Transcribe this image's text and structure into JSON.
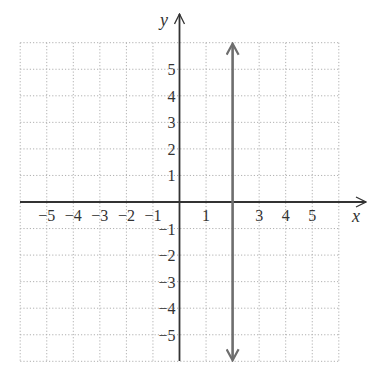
{
  "chart_data": {
    "type": "line",
    "title": "",
    "xlabel": "x",
    "ylabel": "y",
    "xlim": [
      -6,
      6
    ],
    "ylim": [
      -6,
      6
    ],
    "grid": true,
    "x_ticks": [
      -5,
      -4,
      -3,
      -2,
      -1,
      1,
      3,
      4,
      5
    ],
    "y_ticks": [
      5,
      4,
      3,
      2,
      1,
      -1,
      -2,
      -3,
      -4,
      -5
    ],
    "series": [
      {
        "name": "x = 2",
        "kind": "vertical-line",
        "x": [
          2,
          2
        ],
        "y": [
          -6,
          6
        ],
        "arrows": "both",
        "color": "#6e6e6e"
      }
    ]
  },
  "colors": {
    "axis": "#333333",
    "grid": "#b0b0b0",
    "line": "#6e6e6e",
    "text": "#333333"
  }
}
